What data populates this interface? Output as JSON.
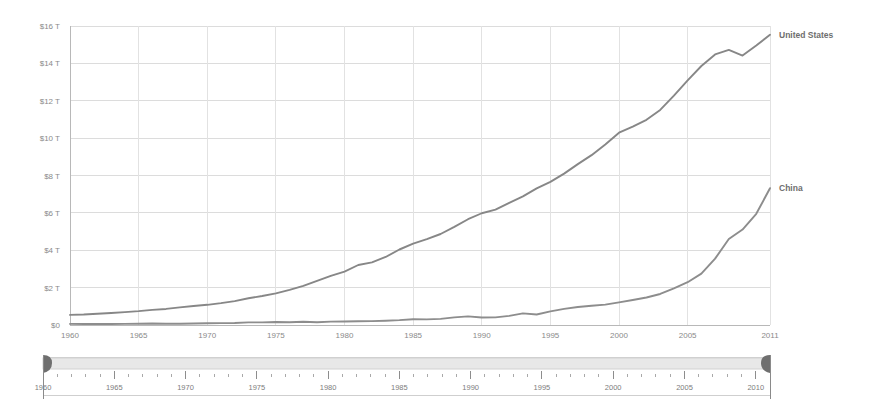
{
  "chart_data": {
    "type": "line",
    "title": "",
    "subtitle": "",
    "xlabel": "",
    "ylabel": "",
    "xlim": [
      1960,
      2011
    ],
    "ylim": [
      0,
      16
    ],
    "grid": true,
    "legend_position": "right-inline",
    "y_unit": "trillions of US dollars",
    "y_tick_labels": [
      "$16 T",
      "$14 T",
      "$12 T",
      "$10 T",
      "$8 T",
      "$6 T",
      "$4 T",
      "$2 T",
      "$0"
    ],
    "y_tick_values": [
      16,
      14,
      12,
      10,
      8,
      6,
      4,
      2,
      0
    ],
    "x_tick_labels": [
      "1960",
      "1965",
      "1970",
      "1975",
      "1980",
      "1985",
      "1990",
      "1995",
      "2000",
      "2005",
      "2011"
    ],
    "x_tick_values": [
      1960,
      1965,
      1970,
      1975,
      1980,
      1985,
      1990,
      1995,
      2000,
      2005,
      2011
    ],
    "x": [
      1960,
      1961,
      1962,
      1963,
      1964,
      1965,
      1966,
      1967,
      1968,
      1969,
      1970,
      1971,
      1972,
      1973,
      1974,
      1975,
      1976,
      1977,
      1978,
      1979,
      1980,
      1981,
      1982,
      1983,
      1984,
      1985,
      1986,
      1987,
      1988,
      1989,
      1990,
      1991,
      1992,
      1993,
      1994,
      1995,
      1996,
      1997,
      1998,
      1999,
      2000,
      2001,
      2002,
      2003,
      2004,
      2005,
      2006,
      2007,
      2008,
      2009,
      2010,
      2011
    ],
    "series": [
      {
        "name": "United States",
        "color": "#878787",
        "label_color": "#6e6e6e",
        "values": [
          0.54,
          0.56,
          0.6,
          0.64,
          0.69,
          0.74,
          0.81,
          0.86,
          0.94,
          1.02,
          1.08,
          1.17,
          1.28,
          1.43,
          1.55,
          1.69,
          1.88,
          2.09,
          2.36,
          2.63,
          2.86,
          3.21,
          3.35,
          3.64,
          4.04,
          4.35,
          4.59,
          4.87,
          5.25,
          5.66,
          5.98,
          6.17,
          6.54,
          6.88,
          7.31,
          7.66,
          8.1,
          8.61,
          9.09,
          9.66,
          10.29,
          10.62,
          10.98,
          11.51,
          12.27,
          13.09,
          13.86,
          14.48,
          14.72,
          14.42,
          14.96,
          15.53
        ],
        "label": "United States",
        "label_at_year": 2011,
        "label_at_value": 15.53
      },
      {
        "name": "China",
        "color": "#8d8d8d",
        "label_color": "#6e6e6e",
        "values": [
          0.06,
          0.05,
          0.05,
          0.05,
          0.06,
          0.07,
          0.08,
          0.07,
          0.07,
          0.08,
          0.09,
          0.1,
          0.11,
          0.14,
          0.14,
          0.16,
          0.15,
          0.17,
          0.15,
          0.18,
          0.19,
          0.2,
          0.21,
          0.23,
          0.26,
          0.31,
          0.3,
          0.33,
          0.41,
          0.46,
          0.4,
          0.41,
          0.49,
          0.62,
          0.56,
          0.73,
          0.86,
          0.96,
          1.03,
          1.09,
          1.21,
          1.34,
          1.47,
          1.66,
          1.96,
          2.29,
          2.75,
          3.55,
          4.6,
          5.11,
          5.95,
          7.32
        ],
        "label": "China",
        "label_at_year": 2011,
        "label_at_value": 7.32
      }
    ]
  },
  "range_slider": {
    "name": "year-range-slider",
    "start_value": 1960,
    "end_value": 2011,
    "min": 1960,
    "max": 2011,
    "tick_labels": [
      "1960",
      "1965",
      "1970",
      "1975",
      "1980",
      "1985",
      "1990",
      "1995",
      "2000",
      "2005",
      "2010"
    ],
    "tick_values": [
      1960,
      1965,
      1970,
      1975,
      1980,
      1985,
      1990,
      1995,
      2000,
      2005,
      2010
    ],
    "minor_tick_step": 1,
    "track_color": "#e8e8e8",
    "handle_color": "#6f6f6f"
  },
  "colors": {
    "background": "#ffffff",
    "gridline": "#dcdcdc",
    "axis": "#b8b8b8",
    "tick_text": "#8a8a8a"
  }
}
